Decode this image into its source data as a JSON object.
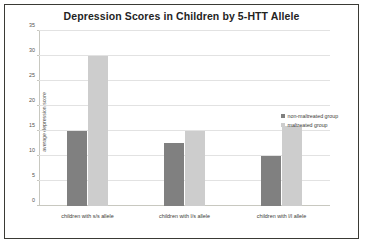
{
  "chart_data": {
    "type": "bar",
    "title": "Depression Scores in Children by 5-HTT Allele",
    "xlabel": "",
    "ylabel": "average depression score",
    "ylim": [
      0,
      35
    ],
    "yticks": [
      0,
      5,
      10,
      15,
      20,
      25,
      30,
      35
    ],
    "grid": true,
    "legend_position": "right",
    "categories": [
      "children with s/s allele",
      "children with l/s allele",
      "children with l/l allele"
    ],
    "series": [
      {
        "name": "non-maltreated group",
        "color": "#808080",
        "values": [
          15,
          12.7,
          10
        ]
      },
      {
        "name": "maltreated group",
        "color": "#cdcdcd",
        "values": [
          30,
          15,
          16
        ]
      }
    ]
  },
  "figure": {
    "border_color": "#3a3a35",
    "background": "#ffffff",
    "gridline_color": "#e2e2e2",
    "axis_color": "#c8c8c0"
  }
}
